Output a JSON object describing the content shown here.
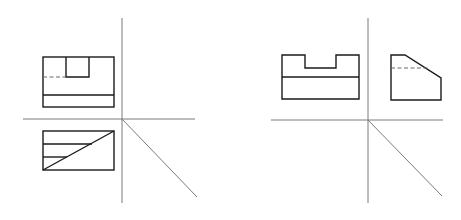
{
  "diagram": {
    "colors": {
      "background": "#ffffff",
      "object_line": "#1a1a1a",
      "axis_line": "#7a7a7a",
      "hidden_line": "#6a6a6a"
    },
    "figures": [
      {
        "id": "left",
        "views": [
          "front",
          "top"
        ],
        "axes": {
          "vertical_x": 122,
          "vertical_y": [
            18,
            203
          ],
          "horizontal_y": 119,
          "horizontal_x": [
            23,
            195
          ],
          "miter_end": [
            197,
            197
          ]
        },
        "front_view": {
          "x": [
            43,
            114
          ],
          "y": [
            57,
            107
          ],
          "notch": {
            "x": [
              66,
              89
            ],
            "y_bottom": 77
          },
          "hidden_line_y": 77,
          "hidden_line_x": [
            43,
            66
          ],
          "divider_y": 95
        },
        "top_view": {
          "x": [
            43,
            114
          ],
          "y": [
            131,
            170
          ],
          "lines_y": [
            144,
            157
          ],
          "diagonal": [
            [
              43,
              170
            ],
            [
              114,
              131
            ]
          ]
        }
      },
      {
        "id": "right",
        "views": [
          "front",
          "side"
        ],
        "axes": {
          "vertical_x": 368,
          "vertical_y": [
            18,
            203
          ],
          "horizontal_y": 120,
          "horizontal_x": [
            271,
            443
          ],
          "miter_end": [
            442,
            196
          ]
        },
        "front_view": {
          "x": [
            282,
            359
          ],
          "y": [
            55,
            99
          ],
          "notch": {
            "x": [
              305,
              336
            ],
            "y_bottom": 68
          },
          "divider_y": 77
        },
        "side_view": {
          "points": [
            [
              391,
              55
            ],
            [
              405,
              55
            ],
            [
              441,
              78
            ],
            [
              441,
              100
            ],
            [
              391,
              100
            ]
          ],
          "hidden_line_y": 68,
          "hidden_line_x": [
            391,
            428
          ]
        }
      }
    ]
  }
}
